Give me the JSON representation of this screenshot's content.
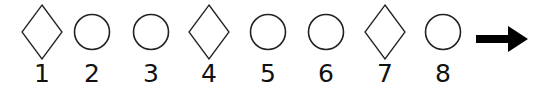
{
  "sequence": {
    "items": [
      {
        "index": "1",
        "shape": "diamond",
        "cx": 42
      },
      {
        "index": "2",
        "shape": "circle",
        "cx": 92
      },
      {
        "index": "3",
        "shape": "circle",
        "cx": 151
      },
      {
        "index": "4",
        "shape": "diamond",
        "cx": 209
      },
      {
        "index": "5",
        "shape": "circle",
        "cx": 268
      },
      {
        "index": "6",
        "shape": "circle",
        "cx": 326
      },
      {
        "index": "7",
        "shape": "diamond",
        "cx": 385
      },
      {
        "index": "8",
        "shape": "circle",
        "cx": 443
      }
    ],
    "continuation": "right-arrow-icon"
  },
  "colors": {
    "stroke": "#222222",
    "arrow": "#000000",
    "background": "#ffffff"
  }
}
